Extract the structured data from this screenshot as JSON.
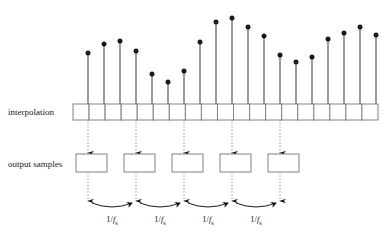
{
  "figure": {
    "background_color": "#ffffff",
    "ink_color": "#1a1a1a",
    "box_stroke_color": "#808080",
    "dotted_color": "#9a9a9a"
  },
  "labels": {
    "interpolation": "interpolation",
    "output_samples": "output samples",
    "period_prefix": "1/",
    "period_symbol": "f",
    "period_subscript": "s",
    "period_full": "1/fs"
  },
  "interpolation_row": {
    "label": "interpolation",
    "x_start": 73,
    "x_end": 378,
    "y_top": 104,
    "y_bottom": 120,
    "cell_count": 19
  },
  "output_row": {
    "label": "output samples",
    "y_top": 154,
    "y_bottom": 172,
    "box_width": 31,
    "box_count": 5,
    "box_x_starts": [
      76,
      124,
      172,
      220,
      268
    ]
  },
  "period_markers": {
    "count": 4,
    "label": "1/fs",
    "arrow_y": 200,
    "label_y": 222,
    "x_pairs": [
      [
        88,
        136
      ],
      [
        136,
        184
      ],
      [
        184,
        232
      ],
      [
        232,
        280
      ]
    ]
  },
  "chart_data": {
    "type": "stem",
    "xlabel": "",
    "ylabel": "",
    "baseline_y": 104,
    "x": [
      88,
      104,
      120,
      136,
      152,
      168,
      184,
      200,
      216,
      232,
      248,
      264,
      280,
      296,
      312,
      328,
      344,
      360,
      376
    ],
    "stem_tip_y": [
      53,
      44,
      41,
      51,
      74,
      82,
      71,
      42,
      22,
      18,
      27,
      36,
      55,
      62,
      57,
      39,
      33,
      27,
      35
    ],
    "values": [
      51,
      60,
      63,
      53,
      30,
      22,
      33,
      62,
      82,
      86,
      77,
      68,
      49,
      42,
      47,
      65,
      71,
      77,
      69
    ],
    "marker": "filled-circle",
    "marker_size": 5,
    "grid": false,
    "legend": null
  },
  "connectors": {
    "interp_to_output": {
      "style": "dotted-with-arrow",
      "x_positions": [
        88,
        136,
        184,
        232,
        280
      ],
      "y_from": 120,
      "y_to": 153
    },
    "output_to_timeline": {
      "style": "dotted-with-arrow",
      "x_positions": [
        88,
        136,
        184,
        232,
        280
      ],
      "y_from": 172,
      "y_to": 201
    }
  }
}
